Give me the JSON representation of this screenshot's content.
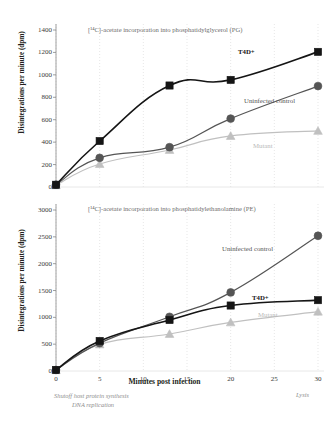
{
  "figure": {
    "xaxis_title": "Minutes post infection",
    "yaxis_title": "Disintegrations per minute (dpm)",
    "annotations": {
      "shutoff": "Shutoff host protein synthesis",
      "dna": "DNA replication",
      "lysis": "Lysis"
    },
    "colors": {
      "t4d": "#151515",
      "uninfected": "#555555",
      "mutant": "#c0c0c0",
      "grid": "#dcdcdc",
      "axis": "#888888",
      "text": "#231f20",
      "muted_text": "#8d8d8d"
    }
  },
  "chart_data": [
    {
      "type": "line",
      "id": "PG",
      "title": "[¹⁴C]-acetate incorporation into phosphatidylglycerol (PG)",
      "xlabel": "Minutes post infection",
      "ylabel": "Disintegrations per minute (dpm)",
      "x": [
        0,
        5,
        13,
        20,
        30
      ],
      "xlim": [
        0,
        30
      ],
      "ylim": [
        0,
        1400
      ],
      "xticks": [
        0,
        5,
        10,
        15,
        20,
        25,
        30
      ],
      "yticks": [
        0,
        200,
        400,
        600,
        800,
        1000,
        1200,
        1400
      ],
      "grid": true,
      "legend": "inline-labels",
      "series": [
        {
          "name": "T4D+",
          "marker": "square",
          "color": "#151515",
          "values": [
            20,
            410,
            905,
            955,
            1205
          ]
        },
        {
          "name": "Uninfected control",
          "marker": "circle",
          "color": "#555555",
          "values": [
            20,
            260,
            355,
            610,
            900
          ]
        },
        {
          "name": "Mutant",
          "marker": "triangle",
          "color": "#c0c0c0",
          "values": [
            15,
            205,
            330,
            455,
            500
          ]
        }
      ]
    },
    {
      "type": "line",
      "id": "PE",
      "title": "[¹⁴C]-acetate incorporation into phosphatidylethanolamine (PE)",
      "xlabel": "Minutes post infection",
      "ylabel": "Disintegrations per minute (dpm)",
      "x": [
        0,
        5,
        13,
        20,
        30
      ],
      "xlim": [
        0,
        30
      ],
      "ylim": [
        0,
        3000
      ],
      "xticks": [
        0,
        5,
        10,
        15,
        20,
        25,
        30
      ],
      "yticks": [
        0,
        500,
        1000,
        1500,
        2000,
        2500,
        3000
      ],
      "grid": true,
      "legend": "inline-labels",
      "series": [
        {
          "name": "T4D+",
          "marker": "square",
          "color": "#151515",
          "values": [
            20,
            560,
            950,
            1220,
            1320
          ]
        },
        {
          "name": "Uninfected control",
          "marker": "circle",
          "color": "#555555",
          "values": [
            20,
            520,
            1010,
            1465,
            2520
          ]
        },
        {
          "name": "Mutant",
          "marker": "triangle",
          "color": "#c0c0c0",
          "values": [
            15,
            495,
            690,
            905,
            1105
          ]
        }
      ]
    }
  ],
  "labels": {
    "pg": {
      "t4d": "T4D+",
      "uninfected": "Uninfected control",
      "mutant": "Mutant"
    },
    "pe": {
      "t4d": "T4D+",
      "uninfected": "Uninfected control",
      "mutant": "Mutant"
    }
  }
}
